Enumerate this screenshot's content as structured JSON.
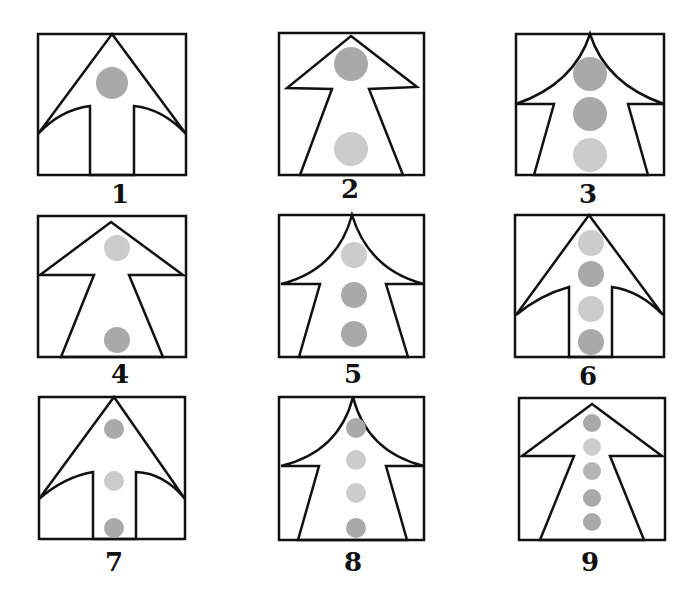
{
  "puzzle": {
    "colors": {
      "stroke": "#111111",
      "dark_dot": "#a9a9a9",
      "light_dot": "#cccccc",
      "background": "#ffffff"
    },
    "panels": [
      {
        "label": "1",
        "shape": "straight-head-narrow-stem-curved-shoulders",
        "dots": [
          "dark"
        ]
      },
      {
        "label": "2",
        "shape": "flat-head-tapered-stem",
        "dots": [
          "dark",
          "light"
        ]
      },
      {
        "label": "3",
        "shape": "curved-head-tapered-stem",
        "dots": [
          "dark",
          "dark",
          "light"
        ]
      },
      {
        "label": "4",
        "shape": "flat-head-tapered-stem",
        "dots": [
          "light",
          "dark"
        ]
      },
      {
        "label": "5",
        "shape": "curved-head-tapered-stem",
        "dots": [
          "light",
          "dark",
          "dark"
        ]
      },
      {
        "label": "6",
        "shape": "straight-head-narrow-stem-curved-shoulders",
        "dots": [
          "light",
          "dark",
          "light",
          "dark"
        ]
      },
      {
        "label": "7",
        "shape": "straight-head-narrow-stem-curved-shoulders",
        "dots": [
          "dark",
          "light",
          "dark"
        ]
      },
      {
        "label": "8",
        "shape": "curved-head-tapered-stem",
        "dots": [
          "dark",
          "light",
          "light",
          "dark"
        ]
      },
      {
        "label": "9",
        "shape": "flat-head-tapered-stem",
        "dots": [
          "dark",
          "light",
          "dark",
          "dark",
          "dark"
        ]
      }
    ]
  }
}
